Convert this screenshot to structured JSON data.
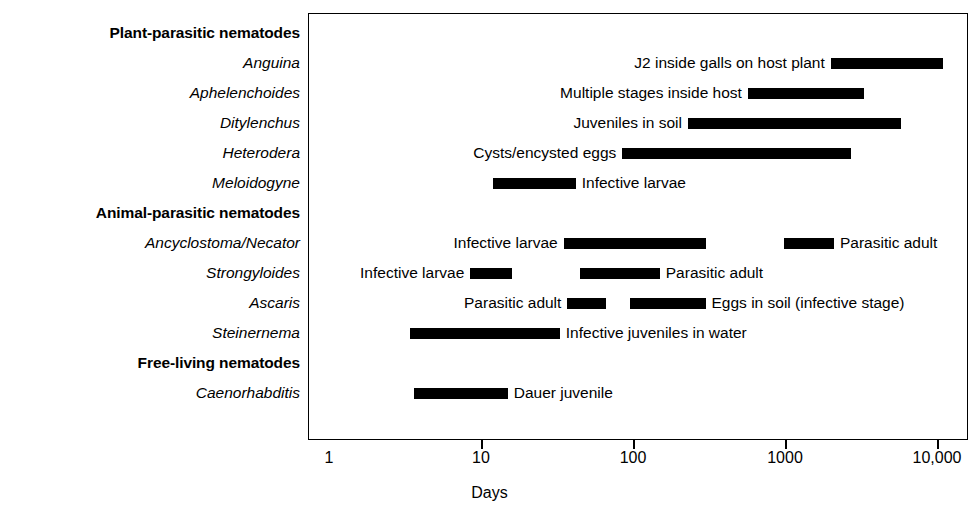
{
  "chart_data": {
    "type": "bar",
    "orientation": "horizontal",
    "title": "",
    "xlabel": "Days",
    "ylabel": "",
    "xscale": "log",
    "xlim": [
      1,
      20000
    ],
    "grid": false,
    "legend": null,
    "xticks": [
      {
        "value": 1,
        "label": "1"
      },
      {
        "value": 10,
        "label": "10"
      },
      {
        "value": 100,
        "label": "100"
      },
      {
        "value": 1000,
        "label": "1000"
      },
      {
        "value": 10000,
        "label": "10,000"
      }
    ],
    "rows": [
      {
        "label": "Plant-parasitic nematodes",
        "kind": "group",
        "bars": []
      },
      {
        "label": "Anguina",
        "kind": "taxon",
        "bars": [
          {
            "start": 2000,
            "end": 11000,
            "annotation": "J2 inside galls on host plant",
            "annotation_side": "left"
          }
        ]
      },
      {
        "label": "Aphelenchoides",
        "kind": "taxon",
        "bars": [
          {
            "start": 570,
            "end": 3300,
            "annotation": "Multiple stages inside host",
            "annotation_side": "left"
          }
        ]
      },
      {
        "label": "Ditylenchus",
        "kind": "taxon",
        "bars": [
          {
            "start": 230,
            "end": 5800,
            "annotation": "Juveniles in soil",
            "annotation_side": "left"
          }
        ]
      },
      {
        "label": "Heterodera",
        "kind": "taxon",
        "bars": [
          {
            "start": 85,
            "end": 2700,
            "annotation": "Cysts/encysted eggs",
            "annotation_side": "left"
          }
        ]
      },
      {
        "label": "Meloidogyne",
        "kind": "taxon",
        "bars": [
          {
            "start": 12,
            "end": 42,
            "annotation": "Infective larvae",
            "annotation_side": "right"
          }
        ]
      },
      {
        "label": "Animal-parasitic nematodes",
        "kind": "group",
        "bars": []
      },
      {
        "label": "Ancyclostoma/Necator",
        "kind": "taxon",
        "bars": [
          {
            "start": 35,
            "end": 300,
            "annotation": "Infective larvae",
            "annotation_side": "left"
          },
          {
            "start": 980,
            "end": 2100,
            "annotation": "Parasitic adult",
            "annotation_side": "right"
          }
        ]
      },
      {
        "label": "Strongyloides",
        "kind": "taxon",
        "bars": [
          {
            "start": 8.5,
            "end": 16,
            "annotation": "Infective larvae",
            "annotation_side": "left"
          },
          {
            "start": 45,
            "end": 150,
            "annotation": "Parasitic adult",
            "annotation_side": "right"
          }
        ]
      },
      {
        "label": "Ascaris",
        "kind": "taxon",
        "bars": [
          {
            "start": 37,
            "end": 66,
            "annotation": "Parasitic adult",
            "annotation_side": "left"
          },
          {
            "start": 95,
            "end": 300,
            "annotation": "Eggs in soil (infective stage)",
            "annotation_side": "right"
          }
        ]
      },
      {
        "label": "Steinernema",
        "kind": "taxon",
        "bars": [
          {
            "start": 3.4,
            "end": 33,
            "annotation": "Infective juveniles in water",
            "annotation_side": "right"
          }
        ]
      },
      {
        "label": "Free-living nematodes",
        "kind": "group",
        "bars": []
      },
      {
        "label": "Caenorhabditis",
        "kind": "taxon",
        "bars": [
          {
            "start": 3.6,
            "end": 15,
            "annotation": "Dauer juvenile",
            "annotation_side": "right"
          }
        ]
      }
    ]
  }
}
